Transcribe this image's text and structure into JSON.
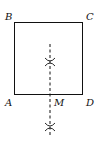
{
  "diagram": {
    "type": "geometry-construction",
    "shape": "square",
    "vertices": [
      {
        "label": "A",
        "position": "bottom-left"
      },
      {
        "label": "B",
        "position": "top-left"
      },
      {
        "label": "C",
        "position": "top-right"
      },
      {
        "label": "D",
        "position": "bottom-right"
      }
    ],
    "midpoint": {
      "label": "M",
      "on_segment": "AD"
    },
    "construction": "perpendicular bisector of AD (dashed) with two arc intersection marks",
    "colors": {
      "stroke": "#111111",
      "background": "#ffffff"
    }
  }
}
